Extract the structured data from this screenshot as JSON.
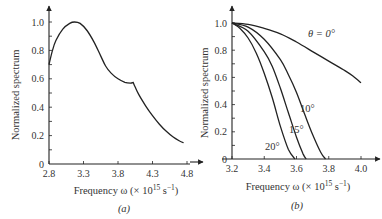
{
  "chart_data": [
    {
      "type": "line",
      "panel": "(a)",
      "title": "",
      "xlabel": "Frequency ω (× 10¹⁵ s⁻¹)",
      "ylabel": "Normalized spectrum",
      "xlim": [
        2.8,
        4.8
      ],
      "ylim": [
        0,
        1.0
      ],
      "x_ticks": [
        "2.8",
        "3.3",
        "3.8",
        "4.3",
        "4.8"
      ],
      "y_ticks": [
        "0",
        "0.2",
        "0.4",
        "0.6",
        "0.8",
        "1.0"
      ],
      "grid": false,
      "series": [
        {
          "name": "spectrum",
          "x": [
            2.8,
            2.85,
            2.9,
            3.0,
            3.1,
            3.17,
            3.25,
            3.35,
            3.45,
            3.55,
            3.62,
            3.7,
            3.8,
            3.9,
            3.98,
            4.02,
            4.05,
            4.1,
            4.2,
            4.3,
            4.4,
            4.5,
            4.6,
            4.7,
            4.75
          ],
          "y": [
            0.7,
            0.8,
            0.87,
            0.95,
            0.99,
            1.0,
            0.99,
            0.94,
            0.86,
            0.76,
            0.69,
            0.64,
            0.6,
            0.575,
            0.57,
            0.575,
            0.54,
            0.49,
            0.41,
            0.34,
            0.28,
            0.23,
            0.19,
            0.16,
            0.15
          ]
        }
      ]
    },
    {
      "type": "line",
      "panel": "(b)",
      "title": "",
      "xlabel": "Frequency ω (× 10¹⁵ s⁻¹)",
      "ylabel": "Normalized spectrum",
      "xlim": [
        3.2,
        4.0
      ],
      "ylim": [
        0,
        1.0
      ],
      "x_ticks": [
        "3.2",
        "3.4",
        "3.6",
        "3.8",
        "4.0"
      ],
      "y_ticks": [
        "0",
        "0.2",
        "0.4",
        "0.6",
        "0.8",
        "1.0"
      ],
      "grid": false,
      "series": [
        {
          "name": "θ = 0°",
          "x": [
            3.2,
            3.3,
            3.4,
            3.5,
            3.6,
            3.7,
            3.8,
            3.9,
            3.95,
            4.0
          ],
          "y": [
            1.0,
            0.99,
            0.96,
            0.92,
            0.86,
            0.79,
            0.72,
            0.65,
            0.61,
            0.56
          ]
        },
        {
          "name": "10°",
          "x": [
            3.2,
            3.3,
            3.4,
            3.5,
            3.55,
            3.6,
            3.65,
            3.7,
            3.75,
            3.78
          ],
          "y": [
            1.0,
            0.97,
            0.88,
            0.73,
            0.62,
            0.49,
            0.33,
            0.18,
            0.05,
            0.0
          ]
        },
        {
          "name": "15°",
          "x": [
            3.2,
            3.3,
            3.4,
            3.45,
            3.5,
            3.55,
            3.6,
            3.64,
            3.66
          ],
          "y": [
            1.0,
            0.94,
            0.79,
            0.68,
            0.52,
            0.34,
            0.16,
            0.04,
            0.0
          ]
        },
        {
          "name": "20°",
          "x": [
            3.2,
            3.25,
            3.3,
            3.35,
            3.4,
            3.45,
            3.5,
            3.55,
            3.59
          ],
          "y": [
            1.0,
            0.96,
            0.89,
            0.78,
            0.63,
            0.45,
            0.24,
            0.07,
            0.0
          ]
        }
      ],
      "annotations": [
        "θ = 0°",
        "10°",
        "15°",
        "20°"
      ]
    }
  ],
  "panels": {
    "a": {
      "label": "(a)",
      "ylabel": "Normalized spectrum",
      "xlabel_prefix": "Frequency ω (× 10",
      "xlabel_exp": "15",
      "xlabel_suffix": " s",
      "xlabel_unit_exp": "−1",
      "xlabel_close": ")"
    },
    "b": {
      "label": "(b)",
      "ylabel": "Normalized spectrum",
      "xlabel_prefix": "Frequency ω (× 10",
      "xlabel_exp": "15",
      "xlabel_suffix": " s",
      "xlabel_unit_exp": "−1",
      "xlabel_close": ")",
      "curve_labels": {
        "theta0": "θ = 0°",
        "deg10": "10°",
        "deg15": "15°",
        "deg20": "20°"
      }
    }
  },
  "colors": {
    "ink": "#222222",
    "background": "#ffffff"
  }
}
